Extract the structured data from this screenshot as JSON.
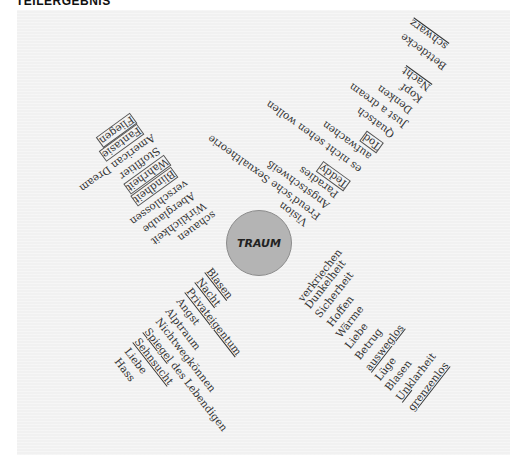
{
  "header": {
    "title": "TEILERGEBNIS"
  },
  "center": {
    "label": "TRAUM",
    "fill": "#b4b4b4"
  },
  "branches": {
    "upper_right_outer": {
      "direction": "up-right, upside-down",
      "words": [
        {
          "text": "schwarz",
          "underline": true
        },
        {
          "text": "Bettdecke"
        },
        {
          "text": "Nacht",
          "underline": true
        },
        {
          "text": "Kopf"
        },
        {
          "text": "Denken"
        },
        {
          "text": "Just a dream"
        },
        {
          "text": "Quatsch"
        },
        {
          "text": "Tod",
          "boxed": true
        },
        {
          "text": "aufwachen"
        },
        {
          "text": "es nicht sehen wollen"
        }
      ]
    },
    "upper_right_inner": {
      "direction": "up-right, upside-down",
      "words": [
        {
          "text": "Teddy",
          "boxed": true
        },
        {
          "text": "Paradies"
        },
        {
          "text": "Angstschweiß"
        },
        {
          "text": "Freud'sche Sexualtheorie"
        },
        {
          "text": "Vision"
        }
      ]
    },
    "upper_left": {
      "direction": "up-left, upside-down",
      "words": [
        {
          "text": "Fliegen",
          "boxed": true
        },
        {
          "text": "Fantasie",
          "boxed": true
        },
        {
          "text": "American Dream"
        },
        {
          "text": "Stoffltier"
        },
        {
          "text": "Wahrheit",
          "boxed": true
        },
        {
          "text": "Blindheit",
          "boxed": true
        },
        {
          "text": "verschlossen"
        },
        {
          "text": "Aberglaube"
        },
        {
          "text": "Wirklichkeit"
        },
        {
          "text": "schauen"
        }
      ]
    },
    "lower_left": {
      "direction": "down-right",
      "words": [
        {
          "text": "Blasen",
          "underline": true
        },
        {
          "text": "Nacht",
          "underline": true
        },
        {
          "text": "Privateigentum",
          "underline": true
        },
        {
          "text": "Angst"
        },
        {
          "text": "Alptraum"
        },
        {
          "text": "Nichtwegkönnen"
        },
        {
          "text": "Spiegel des Lebendigen",
          "underline_part": "Spiegel"
        },
        {
          "text": "Sehnsucht",
          "underline": true
        },
        {
          "text": "Liebe"
        },
        {
          "text": "Hass"
        }
      ]
    },
    "lower_right": {
      "direction": "up-right",
      "words": [
        {
          "text": "verkriechen"
        },
        {
          "text": "Dunkelheit"
        },
        {
          "text": "Sicherheit"
        },
        {
          "text": "Hoffen"
        },
        {
          "text": "Wärme"
        },
        {
          "text": "Liebe"
        },
        {
          "text": "Betrug"
        },
        {
          "text": "ausweglos",
          "underline": true
        },
        {
          "text": "Lüge"
        },
        {
          "text": "Blasen"
        },
        {
          "text": "Unklarheit",
          "underline_part": "Un"
        },
        {
          "text": "grenzenlos",
          "underline": true
        }
      ]
    }
  }
}
